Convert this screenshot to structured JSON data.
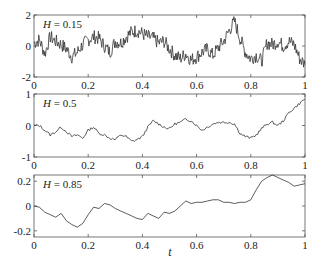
{
  "figure": {
    "xlabel": "t",
    "xticks": [
      "0",
      "0.2",
      "0.4",
      "0.6",
      "0.8",
      "1"
    ]
  },
  "panels": [
    {
      "label": "H = 0.15",
      "label_italic": "H",
      "label_value": " = 0.15",
      "yticks": [
        "2",
        "0",
        "-2"
      ]
    },
    {
      "label": "H = 0.5",
      "label_italic": "H",
      "label_value": " = 0.5",
      "yticks": [
        "1",
        "0",
        "-1"
      ]
    },
    {
      "label": "H = 0.85",
      "label_italic": "H",
      "label_value": " = 0.85",
      "yticks": [
        "0.2",
        "0",
        "-0.2"
      ]
    }
  ],
  "chart_data": [
    {
      "type": "line",
      "title": "H = 0.15",
      "xlabel": "t",
      "ylabel": "",
      "xlim": [
        0,
        1
      ],
      "ylim": [
        -2,
        2
      ],
      "yticks": [
        -2,
        0,
        2
      ],
      "xticks": [
        0,
        0.2,
        0.4,
        0.6,
        0.8,
        1
      ],
      "grid": false,
      "series": [
        {
          "name": "fBm H=0.15",
          "x": [
            0,
            0.02,
            0.04,
            0.06,
            0.08,
            0.1,
            0.12,
            0.14,
            0.16,
            0.18,
            0.2,
            0.22,
            0.24,
            0.26,
            0.28,
            0.3,
            0.32,
            0.34,
            0.36,
            0.38,
            0.4,
            0.42,
            0.44,
            0.46,
            0.48,
            0.5,
            0.52,
            0.54,
            0.56,
            0.58,
            0.6,
            0.62,
            0.64,
            0.66,
            0.68,
            0.7,
            0.72,
            0.74,
            0.76,
            0.78,
            0.8,
            0.82,
            0.84,
            0.86,
            0.88,
            0.9,
            0.92,
            0.94,
            0.96,
            0.98,
            1
          ],
          "y": [
            0.2,
            0.4,
            -0.5,
            0.6,
            0.3,
            0.1,
            -0.2,
            -0.7,
            -0.4,
            0.1,
            0.4,
            0.6,
            0.5,
            0.0,
            -0.4,
            0.3,
            0.2,
            0.6,
            0.9,
            1.0,
            0.8,
            0.6,
            0.5,
            0.2,
            0.3,
            -0.2,
            -0.6,
            -0.8,
            -0.5,
            -0.9,
            -0.7,
            -0.4,
            -0.2,
            -0.6,
            -0.1,
            0.3,
            1.0,
            1.6,
            0.5,
            -0.4,
            -0.8,
            -0.6,
            -1.0,
            0.2,
            0.1,
            0.3,
            0.0,
            0.3,
            0.1,
            -0.8,
            -1.2
          ]
        }
      ]
    },
    {
      "type": "line",
      "title": "H = 0.5",
      "xlabel": "t",
      "ylabel": "",
      "xlim": [
        0,
        1
      ],
      "ylim": [
        -1,
        1
      ],
      "yticks": [
        -1,
        0,
        1
      ],
      "xticks": [
        0,
        0.2,
        0.4,
        0.6,
        0.8,
        1
      ],
      "grid": false,
      "series": [
        {
          "name": "fBm H=0.5",
          "x": [
            0,
            0.02,
            0.04,
            0.06,
            0.08,
            0.1,
            0.12,
            0.14,
            0.16,
            0.18,
            0.2,
            0.22,
            0.24,
            0.26,
            0.28,
            0.3,
            0.32,
            0.34,
            0.36,
            0.38,
            0.4,
            0.42,
            0.44,
            0.46,
            0.48,
            0.5,
            0.52,
            0.54,
            0.56,
            0.58,
            0.6,
            0.62,
            0.64,
            0.66,
            0.68,
            0.7,
            0.72,
            0.74,
            0.76,
            0.78,
            0.8,
            0.82,
            0.84,
            0.86,
            0.88,
            0.9,
            0.92,
            0.94,
            0.96,
            0.98,
            1
          ],
          "y": [
            0.0,
            0.0,
            -0.15,
            -0.3,
            -0.2,
            -0.05,
            -0.2,
            -0.35,
            -0.3,
            -0.4,
            -0.15,
            -0.05,
            -0.25,
            -0.3,
            -0.4,
            -0.45,
            -0.3,
            -0.35,
            -0.5,
            -0.45,
            -0.35,
            -0.05,
            0.15,
            0.05,
            -0.05,
            -0.1,
            0.05,
            0.1,
            0.2,
            0.15,
            0.0,
            -0.15,
            -0.05,
            0.05,
            0.1,
            0.1,
            0.1,
            0.05,
            -0.25,
            -0.35,
            -0.4,
            -0.3,
            -0.1,
            0.05,
            0.1,
            0.0,
            0.15,
            0.4,
            0.55,
            0.7,
            0.85
          ]
        }
      ]
    },
    {
      "type": "line",
      "title": "H = 0.85",
      "xlabel": "t",
      "ylabel": "",
      "xlim": [
        0,
        1
      ],
      "ylim": [
        -0.25,
        0.25
      ],
      "yticks": [
        -0.2,
        0,
        0.2
      ],
      "xticks": [
        0,
        0.2,
        0.4,
        0.6,
        0.8,
        1
      ],
      "grid": false,
      "series": [
        {
          "name": "fBm H=0.85",
          "x": [
            0,
            0.02,
            0.04,
            0.06,
            0.08,
            0.1,
            0.12,
            0.14,
            0.16,
            0.18,
            0.2,
            0.22,
            0.24,
            0.26,
            0.28,
            0.3,
            0.32,
            0.34,
            0.36,
            0.38,
            0.4,
            0.42,
            0.44,
            0.46,
            0.48,
            0.5,
            0.52,
            0.54,
            0.56,
            0.58,
            0.6,
            0.62,
            0.64,
            0.66,
            0.68,
            0.7,
            0.72,
            0.74,
            0.76,
            0.78,
            0.8,
            0.82,
            0.84,
            0.86,
            0.88,
            0.9,
            0.92,
            0.94,
            0.96,
            0.98,
            1
          ],
          "y": [
            0.0,
            -0.01,
            -0.05,
            -0.07,
            -0.09,
            -0.06,
            -0.12,
            -0.15,
            -0.17,
            -0.14,
            -0.07,
            -0.01,
            -0.02,
            0.02,
            0.01,
            -0.02,
            -0.04,
            -0.06,
            -0.08,
            -0.1,
            -0.11,
            -0.06,
            -0.08,
            -0.1,
            -0.05,
            -0.06,
            -0.04,
            0.0,
            0.04,
            0.02,
            0.03,
            0.03,
            0.04,
            0.05,
            0.05,
            0.03,
            0.03,
            0.02,
            0.03,
            0.03,
            0.05,
            0.13,
            0.2,
            0.23,
            0.25,
            0.23,
            0.21,
            0.19,
            0.16,
            0.17,
            0.18
          ]
        }
      ]
    }
  ]
}
